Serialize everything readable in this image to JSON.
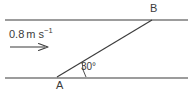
{
  "figure": {
    "type": "geometry-diagram",
    "background_color": "#ffffff",
    "stroke_color": "#3b3b3b",
    "text_color": "#3b3b3b"
  },
  "labels": {
    "point_b": "B",
    "point_a": "A",
    "angle": "30°",
    "speed_value": "0.8",
    "speed_unit_base": "m s",
    "speed_unit_exponent": "−1"
  },
  "geometry": {
    "top_line": {
      "x1": 5,
      "y1": 20,
      "x2": 188,
      "y2": 20
    },
    "bottom_line": {
      "x1": 5,
      "y1": 78,
      "x2": 188,
      "y2": 78
    },
    "diagonal_line": {
      "x1": 57,
      "y1": 77,
      "x2": 152,
      "y2": 20
    },
    "point_a": {
      "x": 57,
      "y": 77
    },
    "point_b": {
      "x": 152,
      "y": 20
    },
    "angle_arc": {
      "cx": 57,
      "cy": 77,
      "radius": 29,
      "degrees": 30
    },
    "velocity_arrow": {
      "x1": 10,
      "y1": 47,
      "x2": 48,
      "y2": 47
    }
  }
}
